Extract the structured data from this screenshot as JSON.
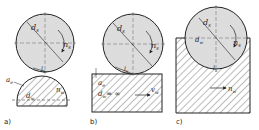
{
  "colors": {
    "line": "#222222",
    "wheel_fill": "#d8d8d8",
    "hatch": "#555555",
    "background": "#ffffff"
  },
  "panels": [
    {
      "id": "a",
      "caption": "a)",
      "labels": {
        "wheel_diameter": "d",
        "wheel_diameter_sub": "s",
        "wheel_speed": "n",
        "wheel_speed_sub": "s",
        "contact_length": "l",
        "contact_length_sub": "k",
        "depth": "a",
        "depth_sub": "e",
        "work_diameter": "d",
        "work_diameter_sub": "w",
        "work_speed": "n",
        "work_speed_sub": "w"
      }
    },
    {
      "id": "b",
      "caption": "b)",
      "labels": {
        "wheel_diameter": "d",
        "wheel_diameter_sub": "s",
        "wheel_speed": "n",
        "wheel_speed_sub": "s",
        "contact_length": "l",
        "contact_length_sub": "k",
        "depth": "a",
        "depth_sub": "e",
        "work_diameter": "d",
        "work_diameter_sub": "w",
        "work_diameter_value": "= ∞",
        "feed": "v",
        "feed_sub": "w"
      }
    },
    {
      "id": "c",
      "caption": "c)",
      "labels": {
        "wheel_diameter": "d",
        "wheel_diameter_sub": "s",
        "wheel_speed": "n",
        "wheel_speed_sub": "s",
        "contact_length": "l",
        "contact_length_sub": "k",
        "work_diameter": "d",
        "work_diameter_sub": "w",
        "work_speed": "n",
        "work_speed_sub": "w"
      }
    }
  ]
}
